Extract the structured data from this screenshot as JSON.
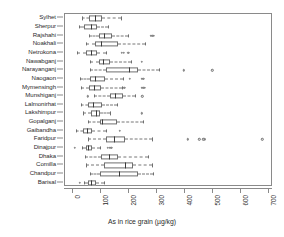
{
  "chart_data": {
    "type": "boxplot",
    "title": "",
    "xlabel": "As in rice grain (µg/kg)",
    "ylabel": "",
    "xlim": [
      0,
      700
    ],
    "xticks": [
      0,
      100,
      200,
      300,
      400,
      500,
      600,
      700
    ],
    "xtick_labels": [
      "0",
      "100",
      "200",
      "300",
      "400",
      "500",
      "600",
      "700"
    ],
    "grid": false,
    "legend": null,
    "orientation": "horizontal",
    "categories": [
      "Sylhet",
      "Sherpur",
      "Rajshahi",
      "Noakhali",
      "Netrokona",
      "Nawabganj",
      "Narayanganj",
      "Naogaon",
      "Mymensingh",
      "Munshiganj",
      "Lalmonirhat",
      "Lakshimpur",
      "Gopalganj",
      "Gaibandha",
      "Faridpur",
      "Dinajpur",
      "Dhaka",
      "Comilla",
      "Chandpur",
      "Barisal"
    ],
    "boxes": [
      {
        "name": "Sylhet",
        "whisker_low": 32,
        "q1": 58,
        "median": 78,
        "q3": 106,
        "whisker_high": 172,
        "outliers": []
      },
      {
        "name": "Sherpur",
        "whisker_low": 22,
        "q1": 42,
        "median": 66,
        "q3": 86,
        "whisker_high": 126,
        "outliers": []
      },
      {
        "name": "Rajshahi",
        "whisker_low": 58,
        "q1": 94,
        "median": 112,
        "q3": 140,
        "whisker_high": 196,
        "outliers": [
          278,
          284,
          290
        ]
      },
      {
        "name": "Noakhali",
        "whisker_low": 48,
        "q1": 78,
        "median": 100,
        "q3": 160,
        "whisker_high": 258,
        "outliers": []
      },
      {
        "name": "Netrokona",
        "whisker_low": 16,
        "q1": 48,
        "median": 66,
        "q3": 88,
        "whisker_high": 120,
        "outliers": [
          176,
          182,
          198
        ]
      },
      {
        "name": "Nawabganj",
        "whisker_low": 62,
        "q1": 94,
        "median": 108,
        "q3": 134,
        "whisker_high": 208,
        "outliers": [
          246
        ]
      },
      {
        "name": "Narayanganj",
        "whisker_low": 62,
        "q1": 120,
        "median": 202,
        "q3": 232,
        "whisker_high": 306,
        "outliers": [
          396,
          498
        ]
      },
      {
        "name": "Naogaon",
        "whisker_low": 26,
        "q1": 62,
        "median": 78,
        "q3": 114,
        "whisker_high": 178,
        "outliers": [
          204,
          246,
          252
        ]
      },
      {
        "name": "Mymensingh",
        "whisker_low": 30,
        "q1": 58,
        "median": 76,
        "q3": 102,
        "whisker_high": 176,
        "outliers": [
          184,
          246,
          252,
          258
        ]
      },
      {
        "name": "Munshiganj",
        "whisker_low": 76,
        "q1": 132,
        "median": 152,
        "q3": 178,
        "whisker_high": 222,
        "outliers": [
          54,
          248
        ]
      },
      {
        "name": "Lalmonirhat",
        "whisker_low": 30,
        "q1": 56,
        "median": 72,
        "q3": 104,
        "whisker_high": 158,
        "outliers": []
      },
      {
        "name": "Lakshimpur",
        "whisker_low": 38,
        "q1": 64,
        "median": 84,
        "q3": 98,
        "whisker_high": 132,
        "outliers": [
          246
        ]
      },
      {
        "name": "Gopalganj",
        "whisker_low": 54,
        "q1": 98,
        "median": 106,
        "q3": 158,
        "whisker_high": 250,
        "outliers": []
      },
      {
        "name": "Gaibandha",
        "whisker_low": 12,
        "q1": 36,
        "median": 50,
        "q3": 70,
        "whisker_high": 118,
        "outliers": [
          168
        ]
      },
      {
        "name": "Faridpur",
        "whisker_low": 56,
        "q1": 118,
        "median": 146,
        "q3": 186,
        "whisker_high": 282,
        "outliers": [
          410,
          452,
          466,
          472,
          676
        ]
      },
      {
        "name": "Dinajpur",
        "whisker_low": 34,
        "q1": 48,
        "median": 56,
        "q3": 68,
        "whisker_high": 96,
        "outliers": [
          8,
          126,
          132,
          138
        ]
      },
      {
        "name": "Dhaka",
        "whisker_low": 44,
        "q1": 100,
        "median": 130,
        "q3": 160,
        "whisker_high": 268,
        "outliers": []
      },
      {
        "name": "Comilla",
        "whisker_low": 46,
        "q1": 110,
        "median": 186,
        "q3": 214,
        "whisker_high": 282,
        "outliers": []
      },
      {
        "name": "Chandpur",
        "whisker_low": 62,
        "q1": 96,
        "median": 164,
        "q3": 232,
        "whisker_high": 288,
        "outliers": []
      },
      {
        "name": "Barisal",
        "whisker_low": 40,
        "q1": 56,
        "median": 66,
        "q3": 82,
        "whisker_high": 112,
        "outliers": [
          26
        ]
      }
    ]
  }
}
